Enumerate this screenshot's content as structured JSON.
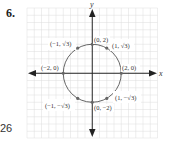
{
  "problem": {
    "number": "6."
  },
  "page": {
    "number": "26"
  },
  "axes": {
    "x_label": "x",
    "y_label": "y"
  },
  "circle": {
    "equation": "x^2 + y^2 = 4",
    "radius": 2,
    "center": [
      0,
      0
    ]
  },
  "points": [
    {
      "x": 0,
      "y": 2,
      "label": "(0, 2)"
    },
    {
      "x": 1,
      "y": 1.732,
      "label": "(1, √3)"
    },
    {
      "x": 2,
      "y": 0,
      "label": "(2, 0)"
    },
    {
      "x": 1,
      "y": -1.732,
      "label": "(1, −√3)"
    },
    {
      "x": 0,
      "y": -2,
      "label": "(0, −2)"
    },
    {
      "x": -1,
      "y": -1.732,
      "label": "(−1, −√3)"
    },
    {
      "x": -2,
      "y": 0,
      "label": "(−2, 0)"
    },
    {
      "x": -1,
      "y": 1.732,
      "label": "(−1, √3)"
    }
  ],
  "colors": {
    "grid": "#d8d8d8",
    "axis": "#222222",
    "circle": "#555555",
    "point": "#666666"
  }
}
